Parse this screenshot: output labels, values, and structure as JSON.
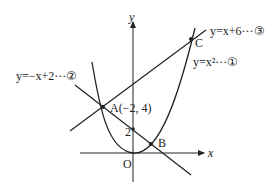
{
  "diagram": {
    "axes": {
      "x_label": "x",
      "y_label": "y",
      "origin_label": "O"
    },
    "curves": [
      {
        "id": "parabola",
        "label": "y=x²···①",
        "equation": "y = x^2"
      },
      {
        "id": "line2",
        "label": "y=−x+2···②",
        "equation": "y = -x + 2"
      },
      {
        "id": "line3",
        "label": "y=x+6···③",
        "equation": "y = x + 6"
      }
    ],
    "points": {
      "A": {
        "label": "A(−2, 4)"
      },
      "B": {
        "label": "B"
      },
      "C": {
        "label": "C"
      },
      "y_intercept": {
        "label": "2"
      }
    },
    "colors": {
      "stroke": "#222222"
    }
  }
}
